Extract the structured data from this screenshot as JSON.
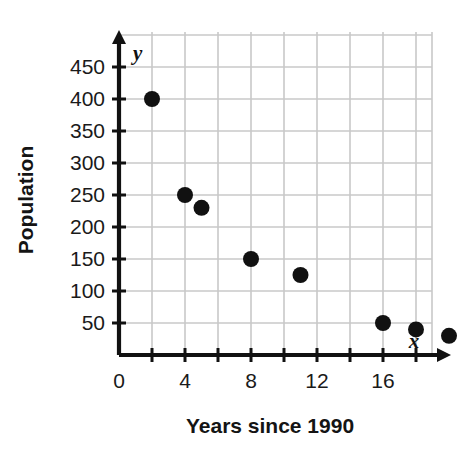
{
  "chart_data": {
    "type": "scatter",
    "title": "",
    "xlabel": "Years since 1990",
    "ylabel": "Population",
    "x_axis_name": "x",
    "y_axis_name": "y",
    "xlim": [
      0,
      19
    ],
    "ylim": [
      0,
      500
    ],
    "grid": true,
    "grid_color": "#c8c8c8",
    "point_color": "#111111",
    "axis_color": "#111111",
    "legend": null,
    "x_tick_step": 2,
    "y_tick_step": 50,
    "xticks": [
      0,
      2,
      4,
      6,
      8,
      10,
      12,
      14,
      16,
      18
    ],
    "xtick_labels": [
      "0",
      "",
      "4",
      "",
      "8",
      "",
      "12",
      "",
      "16",
      ""
    ],
    "yticks": [
      50,
      100,
      150,
      200,
      250,
      300,
      350,
      400,
      450
    ],
    "ytick_labels": [
      "50",
      "100",
      "150",
      "200",
      "250",
      "300",
      "350",
      "400",
      "450"
    ],
    "points": [
      {
        "x": 2,
        "y": 400
      },
      {
        "x": 4,
        "y": 250
      },
      {
        "x": 5,
        "y": 230
      },
      {
        "x": 8,
        "y": 150
      },
      {
        "x": 11,
        "y": 125
      },
      {
        "x": 16,
        "y": 50
      },
      {
        "x": 18,
        "y": 40
      },
      {
        "x": 20,
        "y": 30
      }
    ]
  }
}
